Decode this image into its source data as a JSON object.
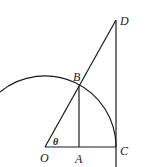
{
  "diagram": {
    "points": {
      "O": {
        "label": "O",
        "x": 45,
        "y": 147
      },
      "A": {
        "label": "A",
        "x": 79,
        "y": 147
      },
      "C": {
        "label": "C",
        "x": 116,
        "y": 147
      },
      "B": {
        "label": "B",
        "x": 79,
        "y": 86
      },
      "D": {
        "label": "D",
        "x": 116,
        "y": 20
      }
    },
    "angle_label": "θ",
    "segments": [
      "OC",
      "OD",
      "BA",
      "DC"
    ],
    "arc": {
      "center": "O",
      "radius": 71
    },
    "colors": {
      "stroke": "#1a1a1a",
      "background": "#ffffff"
    }
  }
}
